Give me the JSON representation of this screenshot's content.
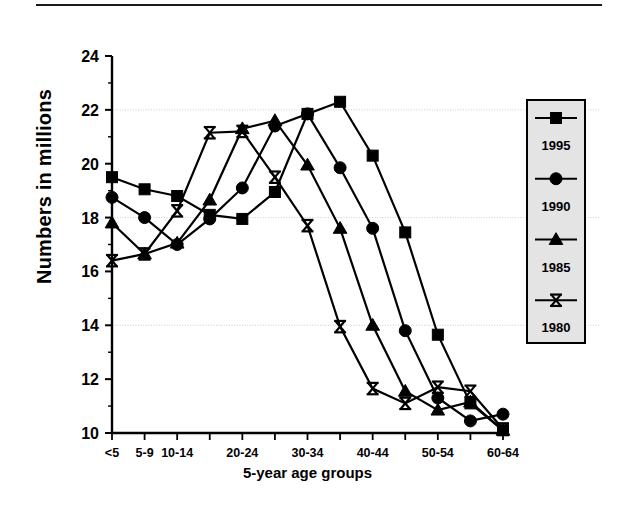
{
  "figure": {
    "has_top_rule": true,
    "background": "#ffffff"
  },
  "chart_data": {
    "type": "line",
    "title": "",
    "xlabel": "5-year age groups",
    "ylabel": "Numbers in millions",
    "ylim": [
      10,
      24
    ],
    "ytick_labels": [
      "10",
      "12",
      "14",
      "16",
      "18",
      "20",
      "22",
      "24"
    ],
    "ytick_values": [
      10,
      12,
      14,
      16,
      18,
      20,
      22,
      24
    ],
    "gridlines": [
      14,
      18,
      22
    ],
    "grid": true,
    "legend_position": "right",
    "categories": [
      "<5",
      "5-9",
      "10-14",
      "15-19",
      "20-24",
      "25-29",
      "30-34",
      "35-39",
      "40-44",
      "45-49",
      "50-54",
      "55-59",
      "60-64"
    ],
    "xtick_labels_shown": [
      "<5",
      "5-9",
      "10-14",
      "",
      "20-24",
      "",
      "30-34",
      "",
      "40-44",
      "",
      "50-54",
      "",
      "60-64"
    ],
    "series": [
      {
        "name": "1995",
        "marker": "square",
        "color": "#000000",
        "values": [
          19.5,
          19.05,
          18.8,
          18.1,
          17.95,
          18.95,
          21.85,
          22.3,
          20.3,
          17.45,
          13.65,
          11.1,
          10.1
        ]
      },
      {
        "name": "1990",
        "marker": "circle",
        "color": "#000000",
        "values": [
          18.75,
          18.0,
          17.0,
          17.95,
          19.1,
          21.4,
          21.85,
          19.85,
          17.6,
          13.8,
          11.3,
          10.45,
          10.7
        ]
      },
      {
        "name": "1985",
        "marker": "triangle",
        "color": "#000000",
        "values": [
          17.8,
          16.65,
          17.05,
          18.65,
          21.3,
          21.6,
          19.95,
          17.6,
          14.0,
          11.55,
          10.85,
          11.15,
          10.1
        ]
      },
      {
        "name": "1980",
        "marker": "star",
        "color": "#000000",
        "values": [
          16.4,
          16.65,
          18.25,
          21.15,
          21.2,
          19.5,
          17.7,
          13.95,
          11.65,
          11.1,
          11.7,
          11.55,
          10.15
        ]
      }
    ]
  },
  "legend": {
    "entries": [
      {
        "label": "1995",
        "marker": "square"
      },
      {
        "label": "1990",
        "marker": "circle"
      },
      {
        "label": "1985",
        "marker": "triangle"
      },
      {
        "label": "1980",
        "marker": "star"
      }
    ],
    "box_fill": "#e4e4e4",
    "box_border": "#000000"
  }
}
